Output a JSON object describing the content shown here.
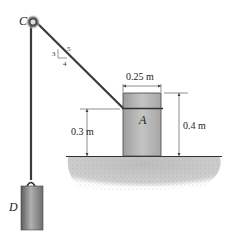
{
  "diagram": {
    "labels": {
      "pulley": "C",
      "block": "A",
      "weight": "D"
    },
    "slope": {
      "rise": "3",
      "run": "4",
      "hyp": "5"
    },
    "dimensions": {
      "block_width": "0.25 m",
      "block_height": "0.4 m",
      "attach_height": "0.3 m"
    },
    "colors": {
      "rope": "#3a3a3a",
      "block": "#b9b9b9",
      "ground": "#c8c8c8",
      "weight": "#8a8a8a"
    }
  }
}
